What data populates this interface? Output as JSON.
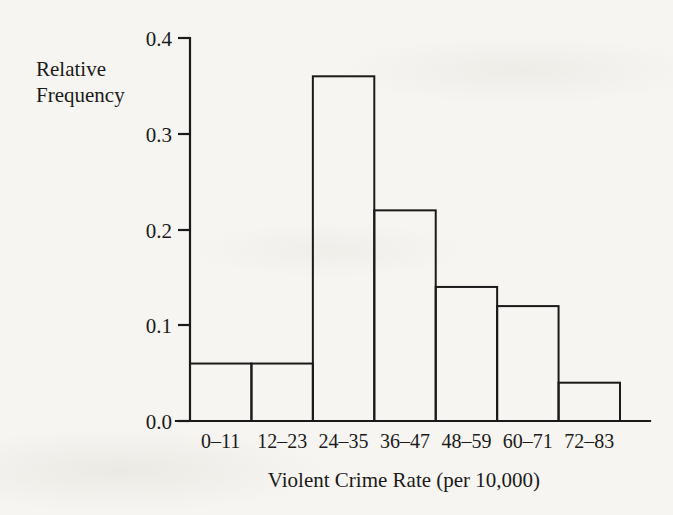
{
  "chart_data": {
    "type": "bar",
    "title": "",
    "xlabel": "Violent Crime Rate (per 10,000)",
    "ylabel": "Relative Frequency",
    "ylabel_line1": "Relative",
    "ylabel_line2": "Frequency",
    "categories": [
      "0–11",
      "12–23",
      "24–35",
      "36–47",
      "48–59",
      "60–71",
      "72–83"
    ],
    "values": [
      0.06,
      0.06,
      0.36,
      0.22,
      0.14,
      0.12,
      0.04
    ],
    "ylim": [
      0.0,
      0.4
    ],
    "ytick_values": [
      0.0,
      0.1,
      0.2,
      0.3,
      0.4
    ],
    "ytick_labels": [
      "0.0",
      "0.1",
      "0.2",
      "0.3",
      "0.4"
    ],
    "grid": false,
    "legend": false,
    "legend_position": "none",
    "bar_fill": "none",
    "bar_edge_color": "#1a1a1a",
    "background_color": "#f7f5f1",
    "text_color": "#1a1a1a"
  },
  "axes": {
    "y_caption_lines": [
      "Relative",
      "Frequency"
    ],
    "x_title": "Violent Crime Rate (per 10,000)"
  }
}
